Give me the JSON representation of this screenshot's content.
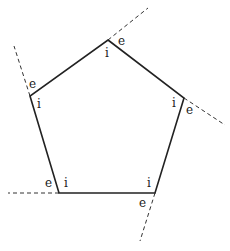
{
  "diagram": {
    "type": "pentagon-interior-exterior-angles",
    "colors": {
      "edge": "#222222",
      "extension": "#333333",
      "label": "#222222",
      "background": "#ffffff"
    },
    "vertices": [
      {
        "name": "top",
        "x": 108,
        "y": 40
      },
      {
        "name": "right",
        "x": 184,
        "y": 98
      },
      {
        "name": "bottom-right",
        "x": 155,
        "y": 193
      },
      {
        "name": "bottom-left",
        "x": 59,
        "y": 193
      },
      {
        "name": "left",
        "x": 30,
        "y": 96
      }
    ],
    "extensions": [
      {
        "from": "top",
        "to_x": 148,
        "to_y": 8
      },
      {
        "from": "right",
        "to_x": 225,
        "to_y": 125
      },
      {
        "from": "bottom-right",
        "to_x": 140,
        "to_y": 241
      },
      {
        "from": "bottom-left",
        "to_x": 8,
        "to_y": 193
      },
      {
        "from": "left",
        "to_x": 14,
        "to_y": 46
      }
    ],
    "labels": [
      {
        "vertex": "top",
        "interior": {
          "text": "i",
          "x": 105,
          "y": 57
        },
        "exterior": {
          "text": "e",
          "x": 118,
          "y": 45
        }
      },
      {
        "vertex": "right",
        "interior": {
          "text": "i",
          "x": 172,
          "y": 107
        },
        "exterior": {
          "text": "e",
          "x": 186,
          "y": 114
        }
      },
      {
        "vertex": "bottom-right",
        "interior": {
          "text": "i",
          "x": 147,
          "y": 187
        },
        "exterior": {
          "text": "e",
          "x": 139,
          "y": 207
        }
      },
      {
        "vertex": "bottom-left",
        "interior": {
          "text": "i",
          "x": 64,
          "y": 187
        },
        "exterior": {
          "text": "e",
          "x": 45,
          "y": 187
        }
      },
      {
        "vertex": "left",
        "interior": {
          "text": "i",
          "x": 37,
          "y": 108
        },
        "exterior": {
          "text": "e",
          "x": 29,
          "y": 88
        }
      }
    ]
  }
}
